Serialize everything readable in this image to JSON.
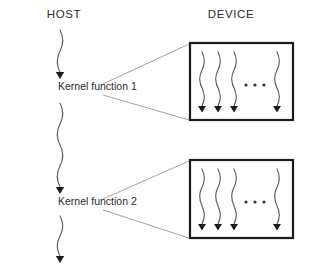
{
  "diagram": {
    "columns": [
      {
        "id": "host",
        "label": "HOST",
        "x": 64,
        "y": 18
      },
      {
        "id": "device",
        "label": "DEVICE",
        "x": 231,
        "y": 18
      }
    ],
    "host_nodes": [
      {
        "id": "kernel-function-1",
        "label": "Kernel function 1",
        "x": 58,
        "y": 90
      },
      {
        "id": "kernel-function-2",
        "label": "Kernel function 2",
        "x": 58,
        "y": 205
      }
    ],
    "host_arrows": [
      {
        "id": "host-arrow-1",
        "x": 60,
        "y_start": 30,
        "y_end": 78
      },
      {
        "id": "host-arrow-2",
        "x": 60,
        "y_start": 103,
        "y_end": 193
      },
      {
        "id": "host-arrow-3",
        "x": 60,
        "y_start": 216,
        "y_end": 262
      }
    ],
    "device_boxes": [
      {
        "id": "device-box-1",
        "label": "Thread block for Kernel function 1",
        "x": 190,
        "y": 43,
        "width": 103,
        "height": 77,
        "threads": [
          202,
          218,
          234,
          277
        ],
        "ellipsis": {
          "x": 255,
          "y": 85,
          "dots": 3
        }
      },
      {
        "id": "device-box-2",
        "label": "Thread block for Kernel function 2",
        "x": 190,
        "y": 160,
        "width": 103,
        "height": 78,
        "threads": [
          202,
          218,
          234,
          277
        ],
        "ellipsis": {
          "x": 255,
          "y": 202,
          "dots": 3
        }
      }
    ],
    "connectors": [
      {
        "id": "connector-k1-top",
        "x1": 103,
        "y1": 84,
        "x2": 189,
        "y2": 44
      },
      {
        "id": "connector-k1-bottom",
        "x1": 103,
        "y1": 95,
        "x2": 189,
        "y2": 120
      },
      {
        "id": "connector-k2-top",
        "x1": 103,
        "y1": 199,
        "x2": 189,
        "y2": 161
      },
      {
        "id": "connector-k2-bottom",
        "x1": 103,
        "y1": 210,
        "x2": 189,
        "y2": 238
      }
    ],
    "colors": {
      "background": "#ffffff",
      "text": "#2b2b2b",
      "box_stroke": "#1c1c1c",
      "wave_stroke": "#555555",
      "connector_stroke": "#8a8a8a",
      "arrowhead": "#1c1c1c"
    }
  }
}
